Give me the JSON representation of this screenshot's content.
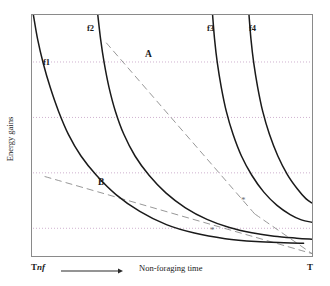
{
  "figure": {
    "background_color": "#ffffff",
    "frame_color": "#7a7a7a",
    "curve_color": "#1a1a1a",
    "dash_color": "#8c8c8c",
    "grid_color": "#c9a9c9"
  },
  "axes": {
    "y_title": "Energy gains",
    "x_title": "Non-foraging time",
    "x_start_label_main": "T",
    "x_start_label_sub": "nf",
    "x_end_label": "T"
  },
  "curve_labels": [
    {
      "name": "f1",
      "text": "f1"
    },
    {
      "name": "f2",
      "text": "f2"
    },
    {
      "name": "f3",
      "text": "f3"
    },
    {
      "name": "f4",
      "text": "f4"
    }
  ],
  "series_labels": [
    {
      "name": "A",
      "text": "A"
    },
    {
      "name": "B",
      "text": "B"
    }
  ],
  "markers": [
    {
      "name": "asterisk-1",
      "text": "*"
    },
    {
      "name": "asterisk-2",
      "text": "*"
    }
  ],
  "chart_data": {
    "type": "line",
    "title": "",
    "xlabel": "Non-foraging time",
    "ylabel": "Energy gains",
    "xlim": [
      0,
      1
    ],
    "ylim": [
      0,
      1
    ],
    "xtick_labels": [
      "Tnf",
      "T"
    ],
    "ytick_labels": [],
    "grid": true,
    "grid_orientation": "horizontal",
    "gridlines_y": [
      0.805,
      0.575,
      0.345,
      0.115
    ],
    "legend_position": "inline-curve-labels",
    "annotations": [
      {
        "label": "A",
        "x": 0.4,
        "y": 0.855,
        "note": "label for upper dashed line"
      },
      {
        "label": "B",
        "x": 0.26,
        "y": 0.315,
        "note": "label for lower dashed line"
      },
      {
        "label": "*",
        "x": 0.795,
        "y": 0.175,
        "note": "optimum on f3"
      },
      {
        "label": "*",
        "x": 0.685,
        "y": 0.085,
        "note": "optimum on f2"
      }
    ],
    "series": [
      {
        "name": "f1",
        "style": "solid",
        "label_x": 0.055,
        "label_y": 0.805,
        "points": [
          [
            0.005,
            1.0
          ],
          [
            0.02,
            0.9
          ],
          [
            0.04,
            0.8
          ],
          [
            0.065,
            0.7
          ],
          [
            0.095,
            0.6
          ],
          [
            0.13,
            0.505
          ],
          [
            0.175,
            0.415
          ],
          [
            0.23,
            0.335
          ],
          [
            0.3,
            0.255
          ],
          [
            0.385,
            0.185
          ],
          [
            0.48,
            0.13
          ],
          [
            0.58,
            0.095
          ],
          [
            0.69,
            0.072
          ],
          [
            0.8,
            0.06
          ],
          [
            0.9,
            0.055
          ],
          [
            0.97,
            0.053
          ]
        ]
      },
      {
        "name": "f2",
        "style": "solid",
        "label_x": 0.205,
        "label_y": 0.955,
        "points": [
          [
            0.235,
            1.0
          ],
          [
            0.245,
            0.9
          ],
          [
            0.258,
            0.8
          ],
          [
            0.275,
            0.7
          ],
          [
            0.298,
            0.6
          ],
          [
            0.328,
            0.505
          ],
          [
            0.368,
            0.415
          ],
          [
            0.418,
            0.335
          ],
          [
            0.478,
            0.262
          ],
          [
            0.548,
            0.2
          ],
          [
            0.625,
            0.152
          ],
          [
            0.705,
            0.118
          ],
          [
            0.785,
            0.096
          ],
          [
            0.865,
            0.082
          ],
          [
            0.945,
            0.074
          ],
          [
            1.0,
            0.07
          ]
        ]
      },
      {
        "name": "f3",
        "style": "solid",
        "label_x": 0.625,
        "label_y": 0.955,
        "points": [
          [
            0.645,
            1.0
          ],
          [
            0.652,
            0.9
          ],
          [
            0.662,
            0.8
          ],
          [
            0.676,
            0.7
          ],
          [
            0.694,
            0.6
          ],
          [
            0.718,
            0.505
          ],
          [
            0.748,
            0.415
          ],
          [
            0.785,
            0.335
          ],
          [
            0.828,
            0.265
          ],
          [
            0.875,
            0.21
          ],
          [
            0.922,
            0.172
          ],
          [
            0.962,
            0.15
          ],
          [
            1.0,
            0.14
          ]
        ]
      },
      {
        "name": "f4",
        "style": "solid",
        "label_x": 0.765,
        "label_y": 0.955,
        "points": [
          [
            0.775,
            1.0
          ],
          [
            0.782,
            0.9
          ],
          [
            0.792,
            0.8
          ],
          [
            0.806,
            0.7
          ],
          [
            0.824,
            0.6
          ],
          [
            0.848,
            0.505
          ],
          [
            0.878,
            0.415
          ],
          [
            0.912,
            0.338
          ],
          [
            0.948,
            0.278
          ],
          [
            0.978,
            0.238
          ],
          [
            1.0,
            0.22
          ]
        ]
      },
      {
        "name": "A",
        "style": "dashed",
        "points": [
          [
            0.265,
            0.885
          ],
          [
            0.795,
            0.175
          ]
        ]
      },
      {
        "name": "B",
        "style": "dashed",
        "points": [
          [
            0.045,
            0.33
          ],
          [
            1.0,
            0.01
          ]
        ]
      },
      {
        "name": "A-extension",
        "style": "dashed",
        "points": [
          [
            0.795,
            0.175
          ],
          [
            1.0,
            0.01
          ]
        ]
      }
    ]
  }
}
